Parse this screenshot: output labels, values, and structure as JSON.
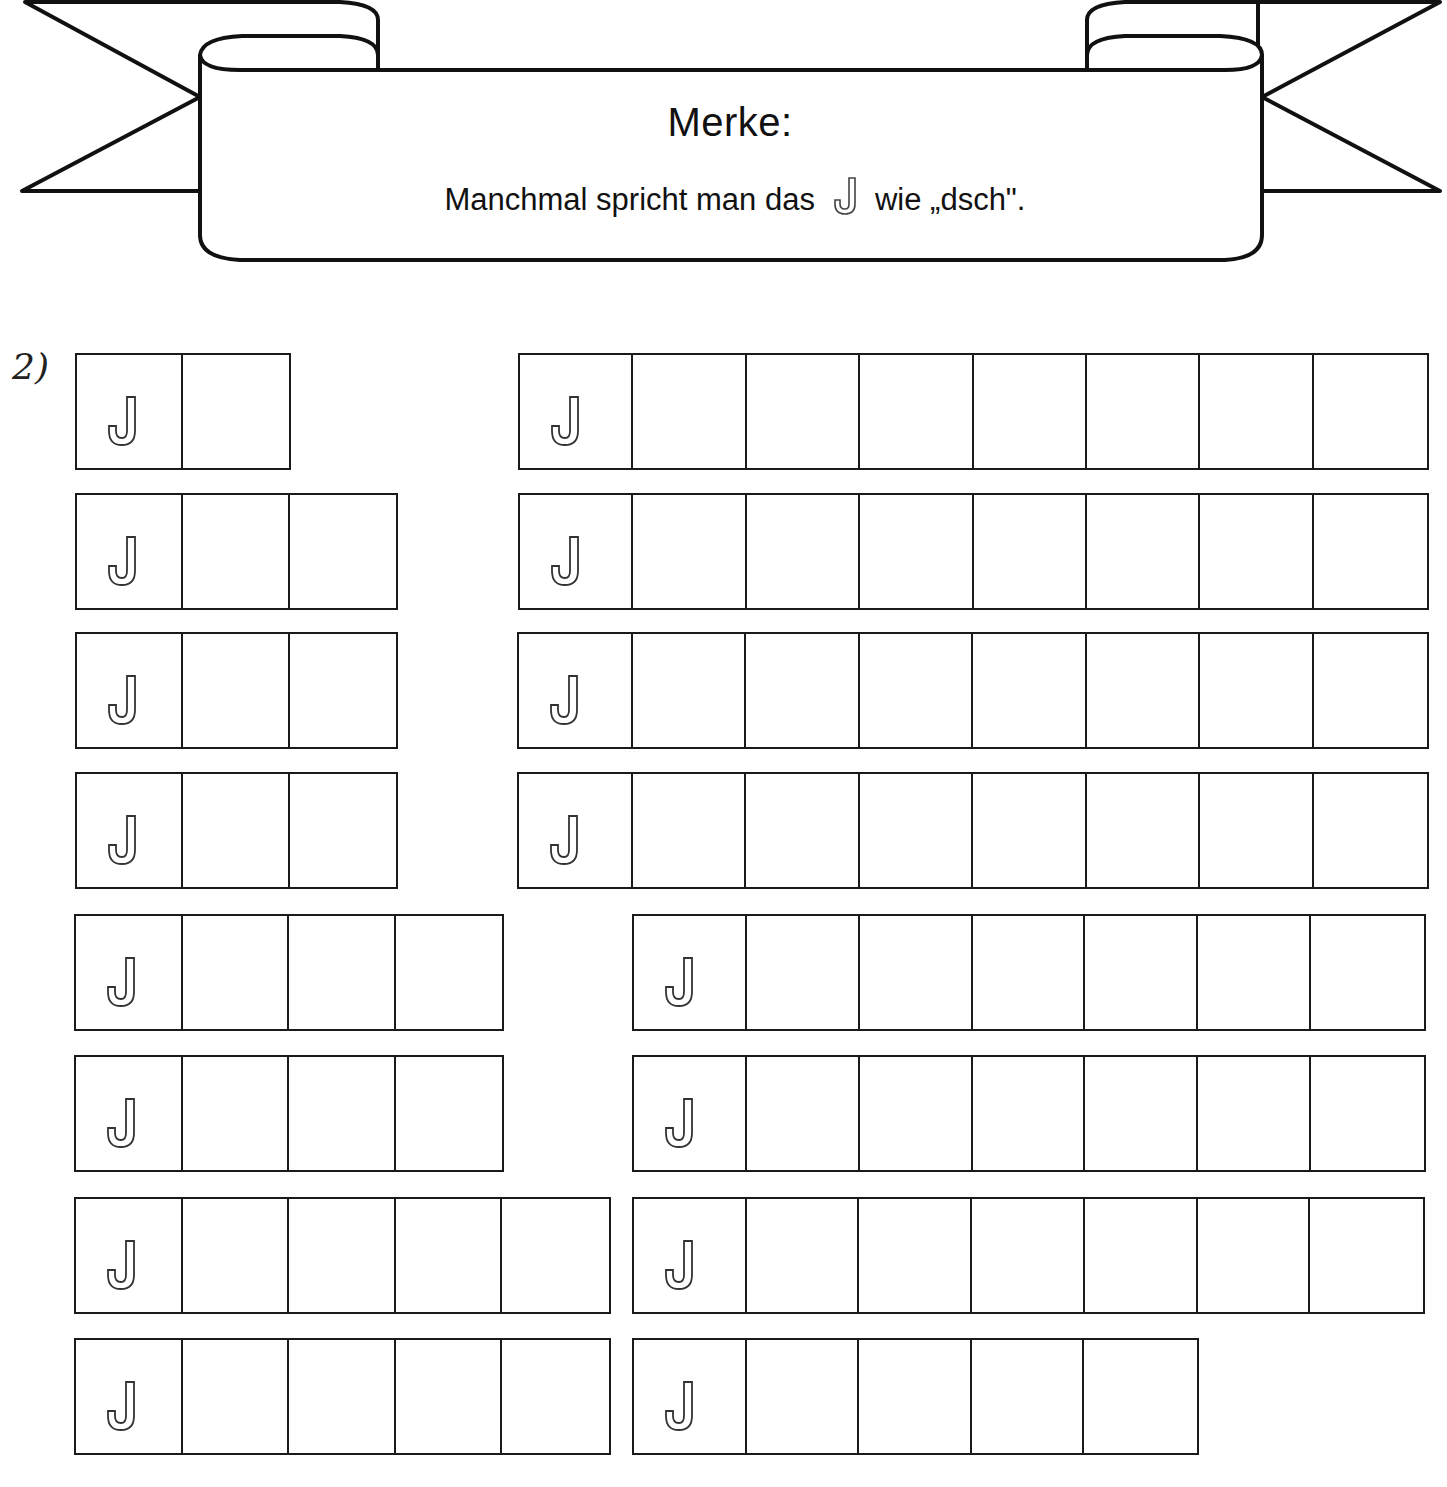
{
  "banner": {
    "title": "Merke:",
    "text_before": "Manchmal spricht man das",
    "letter": "J",
    "text_after": "wie  „dsch\"."
  },
  "exercise": {
    "number": "2)",
    "start_letter": "J",
    "cell_width": 107,
    "cell_height": 117,
    "rows": [
      {
        "left": 75,
        "top": 353,
        "cells": 2
      },
      {
        "left": 75,
        "top": 493,
        "cells": 3
      },
      {
        "left": 75,
        "top": 632,
        "cells": 3
      },
      {
        "left": 75,
        "top": 772,
        "cells": 3
      },
      {
        "left": 74,
        "top": 914,
        "cells": 4
      },
      {
        "left": 74,
        "top": 1055,
        "cells": 4
      },
      {
        "left": 74,
        "top": 1197,
        "cells": 5
      },
      {
        "left": 74,
        "top": 1338,
        "cells": 5
      },
      {
        "left": 518,
        "top": 353,
        "cells": 8,
        "cell_width": 113.6
      },
      {
        "left": 518,
        "top": 493,
        "cells": 8,
        "cell_width": 113.6
      },
      {
        "left": 517,
        "top": 632,
        "cells": 8,
        "cell_width": 113.7
      },
      {
        "left": 517,
        "top": 772,
        "cells": 8,
        "cell_width": 113.7
      },
      {
        "left": 632,
        "top": 914,
        "cells": 7,
        "cell_width": 113.2
      },
      {
        "left": 632,
        "top": 1055,
        "cells": 7,
        "cell_width": 113.2
      },
      {
        "left": 632,
        "top": 1197,
        "cells": 7,
        "cell_width": 113.0
      },
      {
        "left": 632,
        "top": 1338,
        "cells": 5,
        "cell_width": 113.0
      }
    ]
  }
}
